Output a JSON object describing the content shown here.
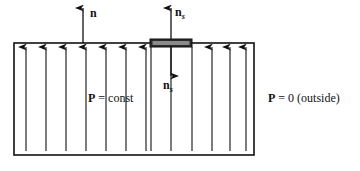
{
  "figure": {
    "background_color": "#ffffff",
    "ink_color": "#111111",
    "width": 360,
    "height": 171
  },
  "labels": {
    "normal_vector": {
      "symbol": "n",
      "subscript": ""
    },
    "surface_normal_up": {
      "symbol": "n",
      "subscript": "s"
    },
    "surface_normal_down": {
      "symbol": "n",
      "subscript": "s"
    },
    "polarization_inside": {
      "symbol": "P",
      "rest": " = const"
    },
    "polarization_outside": {
      "symbol": "P",
      "rest": " = 0 (outside)"
    }
  },
  "geometry": {
    "slab": {
      "x": 14,
      "y": 43,
      "width": 240,
      "height": 112,
      "stroke_width": 1.6
    },
    "plate": {
      "x": 150,
      "y": 39,
      "width": 42,
      "height": 8,
      "fill": "#2a2a2a"
    },
    "normal_arrow": {
      "x": 83,
      "y_top": 8,
      "y_bottom": 43
    },
    "ns_up_arrow": {
      "x": 171,
      "y_top": 8,
      "y_bottom": 39
    },
    "ns_down_arrow": {
      "x": 171,
      "y_top": 47,
      "y_bottom": 76
    },
    "field_line_top": 47,
    "field_line_bottom": 151,
    "field_lines": [
      {
        "x": 26,
        "head": true
      },
      {
        "x": 46,
        "head": true
      },
      {
        "x": 66,
        "head": true
      },
      {
        "x": 86,
        "head": true
      },
      {
        "x": 106,
        "head": true
      },
      {
        "x": 126,
        "head": true
      },
      {
        "x": 146,
        "head": true
      },
      {
        "x": 151,
        "head": false
      },
      {
        "x": 171,
        "head": false
      },
      {
        "x": 192,
        "head": false
      },
      {
        "x": 212,
        "head": true
      },
      {
        "x": 230,
        "head": true
      },
      {
        "x": 246,
        "head": true
      }
    ]
  }
}
